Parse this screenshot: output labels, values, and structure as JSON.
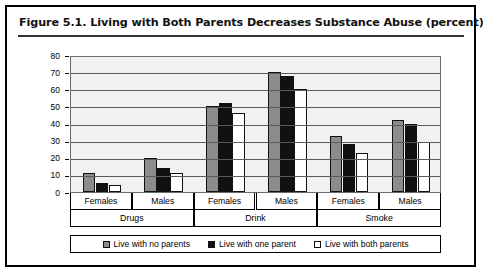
{
  "figure": {
    "title": "Figure 5.1.  Living with Both Parents Decreases Substance Abuse (percent)"
  },
  "chart_data": {
    "type": "bar",
    "title": "Figure 5.1.  Living with Both Parents Decreases Substance Abuse (percent)",
    "xlabel": "",
    "ylabel": "",
    "ylim": [
      0,
      80
    ],
    "yticks": [
      0,
      10,
      20,
      30,
      40,
      50,
      60,
      70,
      80
    ],
    "grid": true,
    "legend_position": "bottom",
    "categories": [
      "Females",
      "Males",
      "Females",
      "Males",
      "Females",
      "Males"
    ],
    "groups": [
      "Drugs",
      "Drink",
      "Smoke"
    ],
    "series": [
      {
        "name": "Live with no parents",
        "color": "#8c8c8c",
        "values": [
          11,
          20,
          50,
          70,
          33,
          42
        ]
      },
      {
        "name": "Live with one parent",
        "color": "#111111",
        "values": [
          5,
          14,
          52,
          68,
          28,
          40
        ]
      },
      {
        "name": "Live with both parents",
        "color": "#ffffff",
        "values": [
          4,
          11,
          46,
          60,
          23,
          29
        ]
      }
    ]
  }
}
